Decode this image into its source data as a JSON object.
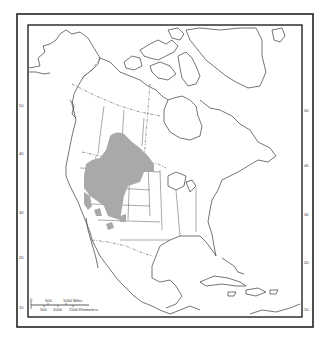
{
  "map": {
    "region": "North America",
    "range_color": "#a9a9a9",
    "latitude_labels_left": [
      "50",
      "40",
      "30",
      "20",
      "10"
    ],
    "latitude_labels_right": [
      "50",
      "40",
      "30",
      "20",
      "10"
    ],
    "scale_bar": {
      "top_labels": [
        "0",
        "500",
        "1000 Miles"
      ],
      "bottom_labels": [
        "500",
        "1000",
        "1500 Kilometers"
      ]
    }
  }
}
